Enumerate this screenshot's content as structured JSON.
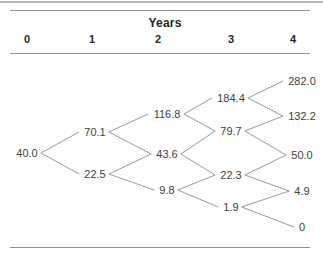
{
  "chart_data": {
    "type": "tree",
    "title": "Years",
    "column_labels": [
      "0",
      "1",
      "2",
      "3",
      "4"
    ],
    "columns": [
      [
        "40.0"
      ],
      [
        "70.1",
        "22.5"
      ],
      [
        "116.8",
        "43.6",
        "9.8"
      ],
      [
        "184.4",
        "79.7",
        "22.3",
        "1.9"
      ],
      [
        "282.0",
        "132.2",
        "50.0",
        "4.9",
        "0"
      ]
    ],
    "edges": [
      [
        0,
        0,
        1,
        0
      ],
      [
        0,
        0,
        1,
        1
      ],
      [
        1,
        0,
        2,
        0
      ],
      [
        1,
        0,
        2,
        1
      ],
      [
        1,
        1,
        2,
        1
      ],
      [
        1,
        1,
        2,
        2
      ],
      [
        2,
        0,
        3,
        0
      ],
      [
        2,
        0,
        3,
        1
      ],
      [
        2,
        1,
        3,
        1
      ],
      [
        2,
        1,
        3,
        2
      ],
      [
        2,
        2,
        3,
        2
      ],
      [
        2,
        2,
        3,
        3
      ],
      [
        3,
        0,
        4,
        0
      ],
      [
        3,
        0,
        4,
        1
      ],
      [
        3,
        1,
        4,
        1
      ],
      [
        3,
        1,
        4,
        2
      ],
      [
        3,
        2,
        4,
        2
      ],
      [
        3,
        2,
        4,
        3
      ],
      [
        3,
        3,
        4,
        3
      ],
      [
        3,
        3,
        4,
        4
      ]
    ]
  },
  "colors": {
    "background": "#fefefe",
    "node_text": "#3f3f3f",
    "header_text": "#262626",
    "edge_line": "#9a9a9a",
    "rule_line": "#8f8f8f",
    "top_bar": "#b9b9b9"
  }
}
